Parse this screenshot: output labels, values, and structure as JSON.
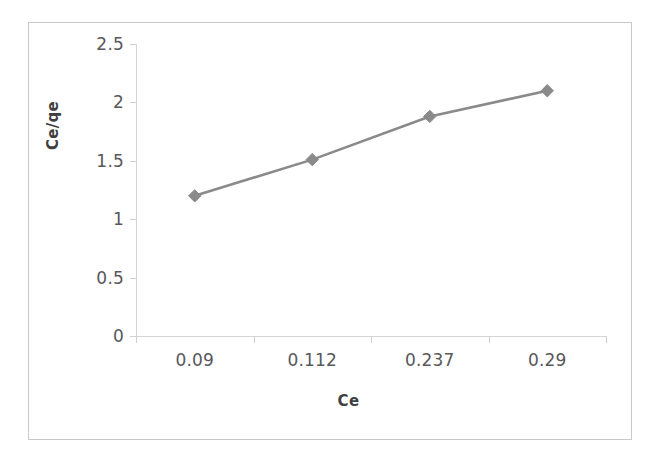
{
  "figure": {
    "background_color": "#ffffff",
    "frame_color": "#c9c9cc",
    "axis_color": "#d4d4d8",
    "tick_label_color": "#58585b",
    "axis_title_color": "#3f3f42"
  },
  "chart_data": {
    "type": "line",
    "title": "",
    "subtitle": "",
    "xlabel": "Ce",
    "ylabel": "Ce/qe",
    "categories": [
      "0.09",
      "0.112",
      "0.237",
      "0.29"
    ],
    "values": [
      1.2,
      1.51,
      1.88,
      2.1
    ],
    "series": [
      {
        "name": "Ce/qe",
        "values": [
          1.2,
          1.51,
          1.88,
          2.1
        ],
        "line_color": "#8a8a8a",
        "marker": "diamond",
        "marker_color": "#8a8a8a"
      }
    ],
    "ylim": [
      0,
      2.5
    ],
    "ytick_values": [
      0,
      0.5,
      1,
      1.5,
      2,
      2.5
    ],
    "ytick_labels": [
      "0",
      "0.5",
      "1",
      "1.5",
      "2",
      "2.5"
    ],
    "xtick_labels": [
      "0.09",
      "0.112",
      "0.237",
      "0.29"
    ],
    "grid": false,
    "legend": false,
    "legend_position": "none",
    "annotations": []
  }
}
